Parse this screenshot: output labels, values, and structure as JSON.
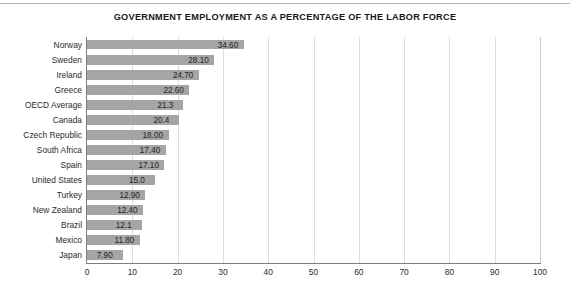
{
  "chart_data": {
    "type": "bar",
    "orientation": "horizontal",
    "title": "GOVERNMENT EMPLOYMENT AS A PERCENTAGE OF THE LABOR FORCE",
    "xlabel": "",
    "ylabel": "",
    "xlim": [
      0,
      100
    ],
    "xticks": [
      "0",
      "10",
      "20",
      "30",
      "40",
      "50",
      "60",
      "70",
      "80",
      "90",
      "100"
    ],
    "grid": true,
    "legend": false,
    "bar_color": "#a5a5a5",
    "categories": [
      "Norway",
      "Sweden",
      "Ireland",
      "Greece",
      "OECD Average",
      "Canada",
      "Czech Republic",
      "South Africa",
      "Spain",
      "United States",
      "Turkey",
      "New Zealand",
      "Brazil",
      "Mexico",
      "Japan"
    ],
    "values": [
      34.6,
      28.1,
      24.7,
      22.6,
      21.3,
      20.4,
      18.0,
      17.4,
      17.1,
      15.0,
      12.9,
      12.4,
      12.1,
      11.8,
      7.9
    ],
    "data_labels": [
      "34.60",
      "28.10",
      "24.70",
      "22.60",
      "21.3",
      "20.4",
      "18.00",
      "17.40",
      "17.10",
      "15.0",
      "12.90",
      "12.40",
      "12.1",
      "11.80",
      "7.90"
    ]
  }
}
